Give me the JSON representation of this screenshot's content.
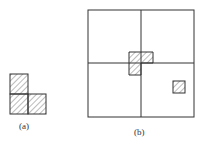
{
  "figure_a": {
    "label": "(a)"
  },
  "figure_b": {
    "label": "(b)"
  },
  "colors": {
    "stroke": "#333333",
    "hatch": "#555555"
  }
}
